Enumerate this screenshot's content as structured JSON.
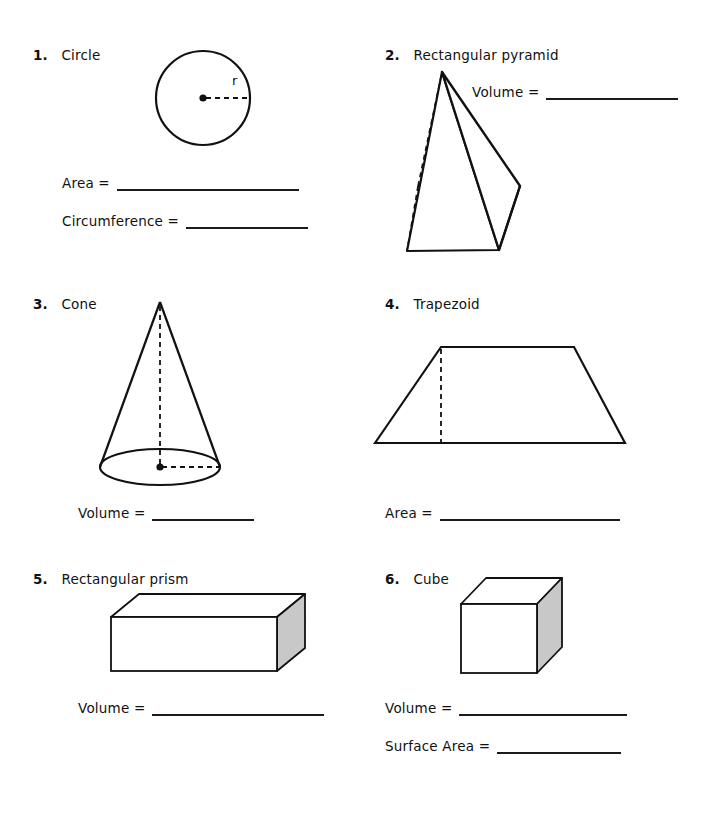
{
  "page": {
    "background": "#ffffff",
    "ink": "#111111",
    "shade_fill": "#c8c8c8",
    "width": 702,
    "height": 840
  },
  "problems": [
    {
      "number": "1.",
      "title": "Circle",
      "figure": "circle-with-radius",
      "figure_labels": [
        {
          "text": "r"
        }
      ],
      "answers": [
        {
          "label": "Area  =",
          "blank_width": 182
        },
        {
          "label": "Circumference  =",
          "blank_width": 122
        }
      ]
    },
    {
      "number": "2.",
      "title": "Rectangular pyramid",
      "figure": "rectangular-pyramid",
      "figure_labels": [],
      "answers": [
        {
          "label": "Volume  =",
          "blank_width": 132
        }
      ]
    },
    {
      "number": "3.",
      "title": "Cone",
      "figure": "cone",
      "figure_labels": [],
      "answers": [
        {
          "label": "Volume  =",
          "blank_width": 102
        }
      ]
    },
    {
      "number": "4.",
      "title": "Trapezoid",
      "figure": "trapezoid",
      "figure_labels": [],
      "answers": [
        {
          "label": "Area  =",
          "blank_width": 180
        }
      ]
    },
    {
      "number": "5.",
      "title": "Rectangular prism",
      "figure": "rectangular-prism",
      "figure_labels": [],
      "answers": [
        {
          "label": "Volume  =",
          "blank_width": 172
        }
      ]
    },
    {
      "number": "6.",
      "title": "Cube",
      "figure": "cube",
      "figure_labels": [],
      "answers": [
        {
          "label": "Volume  =",
          "blank_width": 168
        },
        {
          "label": "Surface Area  =",
          "blank_width": 124
        }
      ]
    }
  ]
}
